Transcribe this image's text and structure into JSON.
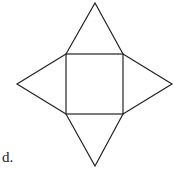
{
  "figure": {
    "label": "d.",
    "stroke_color": "#222222",
    "square": {
      "x1": 66,
      "y1": 54,
      "x2": 123,
      "y2": 114
    },
    "apexes": {
      "top": [
        95,
        3
      ],
      "bottom": [
        95,
        166
      ],
      "left": [
        17,
        84
      ],
      "right": [
        172,
        84
      ]
    }
  }
}
